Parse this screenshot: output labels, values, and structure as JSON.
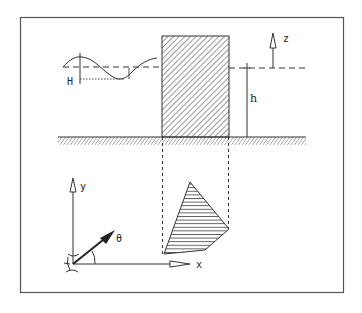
{
  "diagram": {
    "labels": {
      "wave_height": "H",
      "water_depth": "h",
      "vertical_axis": "z",
      "plan_y_axis": "y",
      "plan_x_axis": "x",
      "wave_angle": "θ"
    },
    "elevation_view": {
      "structure": "hatched rectangular block",
      "still_water_level": "dashed line",
      "seabed": "hatched ground line"
    },
    "plan_view": {
      "footprint": "hatched quadrilateral",
      "projection_lines": "dashed vertical lines from block edges"
    },
    "colors": {
      "ink": "#2a2a2a",
      "frame": "#555555",
      "background": "#ffffff"
    }
  }
}
